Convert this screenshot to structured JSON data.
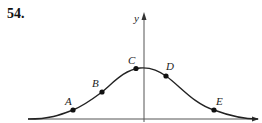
{
  "problem": {
    "number": "54."
  },
  "axes": {
    "y_label": "y"
  },
  "curve": {
    "description": "bell-shaped curve with maximum near the y-axis",
    "color": "#222222"
  },
  "points": [
    {
      "label": "A",
      "x": 73,
      "y": 110
    },
    {
      "label": "B",
      "x": 102,
      "y": 92
    },
    {
      "label": "C",
      "x": 136,
      "y": 69
    },
    {
      "label": "D",
      "x": 166,
      "y": 76
    },
    {
      "label": "E",
      "x": 214,
      "y": 110
    }
  ]
}
